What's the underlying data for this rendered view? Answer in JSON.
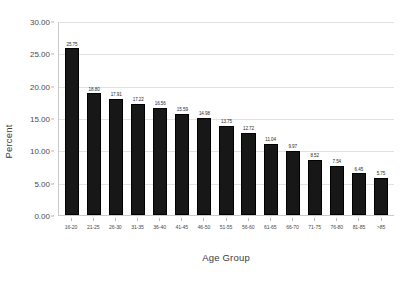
{
  "chart_data": {
    "type": "bar",
    "title": "",
    "xlabel": "Age Group",
    "ylabel": "Percent",
    "categories": [
      "16-20",
      "21-25",
      "26-30",
      "31-35",
      "36-40",
      "41-45",
      "46-50",
      "51-55",
      "56-60",
      "61-65",
      "66-70",
      "71-75",
      "76-80",
      "81-85",
      ">85"
    ],
    "values": [
      25.75,
      18.8,
      17.91,
      17.22,
      16.56,
      15.59,
      14.98,
      13.75,
      12.72,
      11.04,
      9.97,
      8.52,
      7.54,
      6.45,
      5.75
    ],
    "value_labels": [
      "25.75",
      "18.80",
      "17.91",
      "17.22",
      "16.56",
      "15.59",
      "14.98",
      "13.75",
      "12.72",
      "11.04",
      "9.97",
      "8.52",
      "7.54",
      "6.45",
      "5.75"
    ],
    "ylim": [
      0,
      30
    ],
    "y_ticks": [
      0,
      5,
      10,
      15,
      20,
      25,
      30
    ],
    "y_tick_labels": [
      "0.00",
      "5.00",
      "10.00",
      "15.00",
      "20.00",
      "25.00",
      "30.00"
    ],
    "grid": true,
    "legend": "none",
    "bar_color": "#171717",
    "gridline_color": "#e2e2e4",
    "axis_color": "#c9c9c9",
    "background_color": "#ffffff"
  }
}
